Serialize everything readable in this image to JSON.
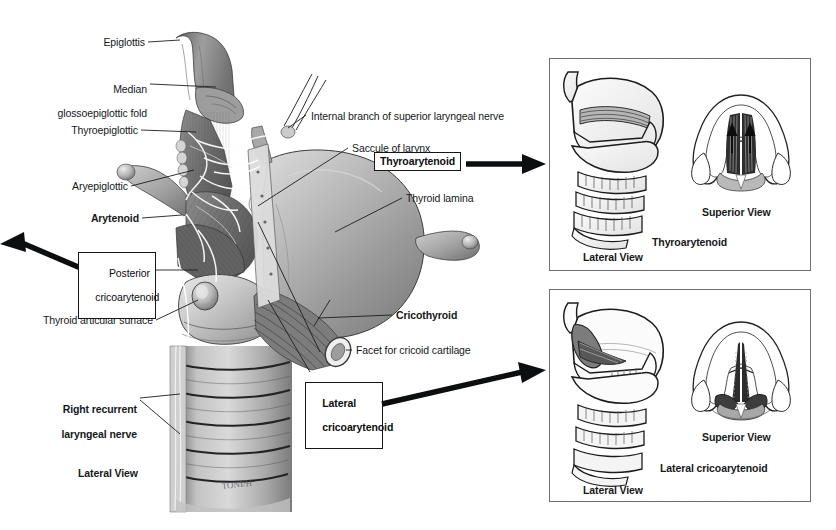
{
  "figure": {
    "background_color": "#ffffff",
    "line_color": "#16181a",
    "panel_border_color": "#6d6f72"
  },
  "main_illustration": {
    "view_caption": "Lateral View",
    "artist_signature": "TONI/H",
    "plain_labels": [
      {
        "id": "epiglottis",
        "text": "Epiglottis",
        "bold": false
      },
      {
        "id": "median-glossoepiglottic-fold",
        "line1": "Median",
        "line2": "glossoepiglottic fold",
        "bold": false
      },
      {
        "id": "thyroepiglottic",
        "text": "Thyroepiglottic",
        "bold": false
      },
      {
        "id": "aryepiglottic",
        "text": "Aryepiglottic",
        "bold": false
      },
      {
        "id": "arytenoid",
        "text": "Arytenoid",
        "bold": true
      },
      {
        "id": "thyroid-articular-surface",
        "text": "Thyroid articular surface",
        "bold": false
      },
      {
        "id": "right-recurrent-laryngeal-nerve",
        "line1": "Right recurrent",
        "line2": "laryngeal nerve",
        "bold": true
      },
      {
        "id": "internal-branch-superior-laryngeal-nerve",
        "text": "Internal branch of superior laryngeal nerve",
        "bold": false
      },
      {
        "id": "saccule-of-larynx",
        "text": "Saccule of larynx",
        "bold": false
      },
      {
        "id": "thyroid-lamina",
        "text": "Thyroid lamina",
        "bold": false
      },
      {
        "id": "cricothyroid",
        "text": "Cricothyroid",
        "bold": true
      },
      {
        "id": "facet-for-cricoid-cartilage",
        "text": "Facet for cricoid cartilage",
        "bold": false
      }
    ],
    "boxed_labels": [
      {
        "id": "posterior-cricoarytenoid",
        "line1": "Posterior",
        "line2": "cricoarytenoid",
        "arrow": "left"
      },
      {
        "id": "thyroarytenoid",
        "line1": "Thyroarytenoid",
        "line2": "",
        "arrow": "right"
      },
      {
        "id": "lateral-cricoarytenoid",
        "line1": "Lateral",
        "line2": "cricoarytenoid",
        "arrow": "right"
      }
    ]
  },
  "inset_panels": [
    {
      "id": "thyroarytenoid-panel",
      "muscle_name": "Thyroarytenoid",
      "lateral_caption": "Lateral View",
      "superior_caption": "Superior View"
    },
    {
      "id": "lateral-cricoarytenoid-panel",
      "muscle_name": "Lateral cricoarytenoid",
      "lateral_caption": "Lateral View",
      "superior_caption": "Superior View"
    }
  ]
}
